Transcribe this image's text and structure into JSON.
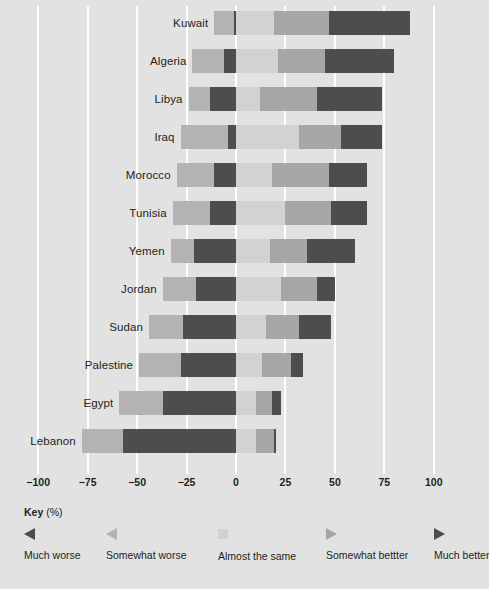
{
  "chart_data": {
    "type": "bar",
    "subtype": "diverging-stacked-bar",
    "title": "",
    "xlabel": "",
    "ylabel": "",
    "xlim": [
      -100,
      100
    ],
    "xticks": [
      -100,
      -75,
      -50,
      -25,
      0,
      25,
      50,
      75,
      100
    ],
    "xticklabels": [
      "−100",
      "−75",
      "−50",
      "−25",
      "0",
      "25",
      "50",
      "75",
      "100"
    ],
    "grid": true,
    "legend_position": "bottom",
    "categories": [
      "Kuwait",
      "Algeria",
      "Libya",
      "Iraq",
      "Morocco",
      "Tunisia",
      "Yemen",
      "Jordan",
      "Sudan",
      "Palestine",
      "Egypt",
      "Lebanon"
    ],
    "series": [
      {
        "name": "Much worse",
        "key": "mw",
        "color": "#4d4d4d",
        "values": [
          -1,
          -6,
          -13,
          -4,
          -11,
          -13,
          -21,
          -20,
          -27,
          -28,
          -37,
          -57
        ]
      },
      {
        "name": "Somewhat worse",
        "key": "sw",
        "color": "#b3b3b3",
        "values": [
          -10,
          -16,
          -11,
          -24,
          -19,
          -19,
          -12,
          -17,
          -17,
          -21,
          -22,
          -21
        ]
      },
      {
        "name": "Almost the same",
        "key": "ats",
        "color": "#d2d2d2",
        "values": [
          19,
          21,
          12,
          32,
          18,
          25,
          17,
          23,
          15,
          13,
          10,
          10
        ]
      },
      {
        "name": "Somewhat bettter",
        "key": "sb",
        "color": "#a6a6a6",
        "values": [
          28,
          24,
          29,
          21,
          29,
          23,
          19,
          18,
          17,
          15,
          8,
          9
        ]
      },
      {
        "name": "Much better",
        "key": "mb",
        "color": "#4d4d4d",
        "values": [
          41,
          35,
          33,
          21,
          19,
          18,
          24,
          9,
          16,
          6,
          5,
          1
        ]
      }
    ]
  },
  "axis": {
    "ticks": [
      {
        "label": "−100",
        "value": -100
      },
      {
        "label": "−75",
        "value": -75
      },
      {
        "label": "−50",
        "value": -50
      },
      {
        "label": "−25",
        "value": -25
      },
      {
        "label": "0",
        "value": 0
      },
      {
        "label": "25",
        "value": 25
      },
      {
        "label": "50",
        "value": 50
      },
      {
        "label": "75",
        "value": 75
      },
      {
        "label": "100",
        "value": 100
      }
    ]
  },
  "key": {
    "title_strong": "Key",
    "title_unit": " (%)",
    "items": [
      {
        "label": "Much worse",
        "marker": "triangle-left-dark",
        "color": "#4d4d4d"
      },
      {
        "label": "Somewhat worse",
        "marker": "triangle-left-light",
        "color": "#b3b3b3"
      },
      {
        "label": "Almost the same",
        "marker": "square-lightest",
        "color": "#d2d2d2"
      },
      {
        "label": "Somewhat bettter",
        "marker": "triangle-right-light",
        "color": "#a6a6a6"
      },
      {
        "label": "Much better",
        "marker": "triangle-right-dark",
        "color": "#4d4d4d"
      }
    ]
  },
  "theme": {
    "background": "#e2e2e2",
    "gridline": "#ffffff",
    "text": "#231f20"
  }
}
